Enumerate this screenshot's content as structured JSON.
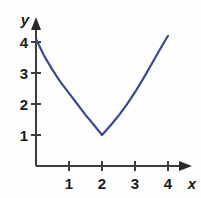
{
  "chart_data": {
    "type": "line",
    "title": "",
    "xlabel": "x",
    "ylabel": "y",
    "xlim": [
      0,
      4.5
    ],
    "ylim": [
      0,
      4.6
    ],
    "grid": false,
    "legend": "none",
    "xticks": [
      "1",
      "2",
      "3",
      "4"
    ],
    "xtick_values": [
      1,
      2,
      3,
      4
    ],
    "yticks": [
      "1",
      "2",
      "3",
      "4"
    ],
    "ytick_values": [
      1,
      2,
      3,
      4
    ],
    "series": [
      {
        "name": "curve",
        "color": "#3a4a8c",
        "vertex": [
          2,
          1
        ],
        "x": [
          0,
          0.25,
          0.5,
          0.75,
          1.0,
          1.25,
          1.5,
          1.75,
          2.0,
          2.25,
          2.5,
          2.75,
          3.0,
          3.25,
          3.5,
          3.75,
          4.0
        ],
        "values": [
          4.1,
          3.55,
          3.1,
          2.7,
          2.35,
          2.0,
          1.65,
          1.33,
          1.0,
          1.3,
          1.62,
          1.98,
          2.38,
          2.82,
          3.28,
          3.75,
          4.2
        ]
      }
    ]
  },
  "axes": {
    "x_axis_label": "x",
    "y_axis_label": "y",
    "axis_color": "#3d3d3d",
    "curve_color": "#3a4a8c"
  },
  "icons": {
    "x_arrow": "x-axis-arrow-icon",
    "y_arrow": "y-axis-arrow-icon"
  }
}
